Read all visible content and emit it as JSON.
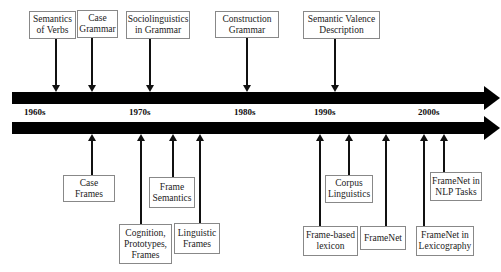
{
  "timeline": {
    "decades": [
      {
        "label": "1960s",
        "x": 24
      },
      {
        "label": "1970s",
        "x": 129
      },
      {
        "label": "1980s",
        "x": 234
      },
      {
        "label": "1990s",
        "x": 314
      },
      {
        "label": "2000s",
        "x": 418
      }
    ],
    "upper_events": [
      {
        "label": "Semantics\nof Verbs",
        "box": [
          29,
          11,
          47,
          28
        ],
        "arrow_x": 56
      },
      {
        "label": "Case\nGrammar",
        "box": [
          77,
          10,
          41,
          28
        ],
        "arrow_x": 92
      },
      {
        "label": "Sociolinguistics\nin Grammar",
        "box": [
          126,
          11,
          64,
          28
        ],
        "arrow_x": 150
      },
      {
        "label": "Construction\nGrammar",
        "box": [
          215,
          11,
          64,
          27
        ],
        "arrow_x": 247
      },
      {
        "label": "Semantic Valence\nDescription",
        "box": [
          303,
          11,
          77,
          28
        ],
        "arrow_x": 335
      }
    ],
    "lower_events": [
      {
        "label": "Case\nFrames",
        "box": [
          63,
          175,
          52,
          27
        ],
        "arrow_x": 92
      },
      {
        "label": "Cognition,\nPrototypes,\nFrames",
        "box": [
          119,
          224,
          53,
          40
        ],
        "arrow_x": 141
      },
      {
        "label": "Frame\nSemantics",
        "box": [
          149,
          177,
          46,
          31
        ],
        "arrow_x": 173
      },
      {
        "label": "Linguistic\nFrames",
        "box": [
          174,
          223,
          46,
          31
        ],
        "arrow_x": 200
      },
      {
        "label": "Frame-based\nlexicon",
        "box": [
          303,
          226,
          55,
          30
        ],
        "arrow_x": 320
      },
      {
        "label": "Corpus\nLinguistics",
        "box": [
          325,
          175,
          48,
          28
        ],
        "arrow_x": 349
      },
      {
        "label": "FrameNet",
        "box": [
          360,
          226,
          46,
          24
        ],
        "arrow_x": 386
      },
      {
        "label": "FrameNet in\nLexicography",
        "box": [
          416,
          226,
          58,
          30
        ],
        "arrow_x": 424
      },
      {
        "label": "FrameNet in\nNLP Tasks",
        "box": [
          430,
          172,
          52,
          29
        ],
        "arrow_x": 444
      }
    ]
  }
}
